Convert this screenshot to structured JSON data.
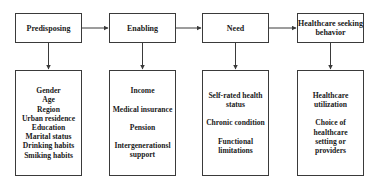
{
  "diagram": {
    "stages": [
      {
        "label": "Predisposing",
        "factors": [
          "Gender",
          "Age",
          "Region",
          "Urban residence",
          "Education",
          "Marital status",
          "Drinking habits",
          "Smiking habits"
        ]
      },
      {
        "label": "Enabling",
        "factors": [
          "Income",
          "Medical insurance",
          "Pension",
          "Intergenerationsl support"
        ]
      },
      {
        "label": "Need",
        "factors": [
          "Self-rated health status",
          "Chronic condition",
          "Functional limitations"
        ]
      },
      {
        "label": "Healthcare seeking behavior",
        "factors": [
          "Healthcare utilization",
          "Choice of healthcare setting or providers"
        ]
      }
    ],
    "colors": {
      "line": "#3a3a3a",
      "text": "#1a1a1a",
      "background": "#ffffff"
    }
  }
}
